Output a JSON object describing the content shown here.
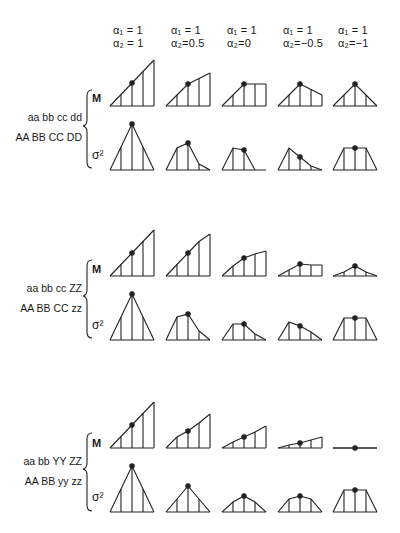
{
  "columns": [
    {
      "alpha1": "α₁ = 1",
      "alpha2": "α₂ = 1"
    },
    {
      "alpha1": "α₁ = 1",
      "alpha2": "α₂=0.5"
    },
    {
      "alpha1": "α₁ = 1",
      "alpha2": "α₂=0"
    },
    {
      "alpha1": "α₁ = 1",
      "alpha2": "α₂=−0.5"
    },
    {
      "alpha1": "α₁ = 1",
      "alpha2": "α₂=−1"
    }
  ],
  "row_labels": {
    "mean": "M",
    "variance": "σ²"
  },
  "groups": [
    {
      "genotype_top": "aa bb cc dd",
      "genotype_bottom": "AA BB CC DD",
      "M": [
        [
          0,
          11.5,
          23,
          34.5,
          46
        ],
        [
          0,
          11,
          22,
          27.5,
          33
        ],
        [
          0,
          11,
          22,
          22,
          22
        ],
        [
          0,
          11,
          22,
          16.5,
          11
        ],
        [
          0,
          11,
          22,
          11,
          0
        ]
      ],
      "V": [
        [
          0,
          23,
          46,
          23,
          0
        ],
        [
          0,
          22,
          27,
          6,
          0
        ],
        [
          0,
          22,
          20,
          0,
          null
        ],
        [
          0,
          22,
          13,
          4,
          0
        ],
        [
          0,
          22,
          22,
          22,
          0
        ]
      ]
    },
    {
      "genotype_top": "aa bb cc ZZ",
      "genotype_bottom": "AA BB CC zz",
      "M": [
        [
          0,
          11.5,
          23,
          34.5,
          42
        ],
        [
          0,
          10,
          18,
          22,
          25
        ],
        [
          0,
          6,
          12,
          11,
          11
        ],
        [
          0,
          4,
          10,
          4,
          0
        ]
      ],
      "V": [
        [
          0,
          23,
          26,
          9,
          0
        ],
        [
          0,
          16,
          16,
          6,
          0
        ],
        [
          0,
          18,
          14,
          8,
          0
        ],
        [
          0,
          22,
          22,
          22,
          0
        ]
      ]
    },
    {
      "genotype_top": "aa bb YY ZZ",
      "genotype_bottom": "AA BB yy zz",
      "M": [
        [
          0,
          11,
          17,
          25,
          34
        ],
        [
          0,
          6,
          11,
          16,
          22
        ],
        [
          0,
          3,
          5,
          8,
          11
        ],
        [
          0,
          0,
          0,
          0,
          0
        ]
      ],
      "V": [
        [
          0,
          13,
          26,
          13,
          0
        ],
        [
          0,
          10,
          16,
          10,
          0
        ],
        [
          0,
          13,
          16,
          13,
          0
        ],
        [
          0,
          22,
          22,
          22,
          0
        ]
      ]
    }
  ],
  "chart_data": {
    "type": "diagram",
    "title": "",
    "columns": [
      "α1=1, α2=1",
      "α1=1, α2=0.5",
      "α1=1, α2=0",
      "α1=1, α2=-0.5",
      "α1=1, α2=-1"
    ],
    "rows": [
      "aa bb cc dd / AA BB CC DD",
      "aa bb cc ZZ / AA BB CC zz",
      "aa bb YY ZZ / AA BB yy zz"
    ],
    "sub_rows": [
      "M",
      "σ²"
    ]
  }
}
